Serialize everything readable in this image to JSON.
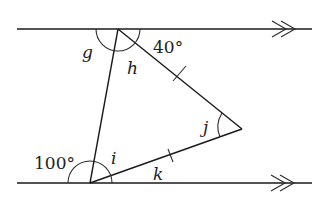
{
  "diagram": {
    "type": "geometry-parallel-lines-triangle",
    "parallel_lines": {
      "count": 2,
      "marker": "double-arrow"
    },
    "triangle": {
      "equal_sides_marked": true,
      "tick_marks": 2
    },
    "labels": {
      "g": "g",
      "h": "h",
      "i": "i",
      "j": "j",
      "k": "k",
      "angle_top_right": "40°",
      "angle_bottom_left": "100°"
    },
    "angles": {
      "top_right_degrees": 40,
      "bottom_left_degrees": 100
    }
  }
}
